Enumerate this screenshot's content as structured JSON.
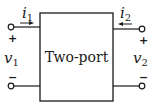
{
  "diagram": {
    "type": "circuit",
    "block": {
      "label": "Two-port"
    },
    "port1": {
      "current": {
        "symbol": "i",
        "subscript": "1",
        "arrow_direction": "right"
      },
      "voltage": {
        "symbol": "v",
        "subscript": "1"
      },
      "plus": "+",
      "minus": "−"
    },
    "port2": {
      "current": {
        "symbol": "i",
        "subscript": "2",
        "arrow_direction": "left"
      },
      "voltage": {
        "symbol": "v",
        "subscript": "2"
      },
      "plus": "+",
      "minus": "−"
    },
    "colors": {
      "stroke": "#1a1a1a",
      "background": "#ffffff"
    }
  }
}
